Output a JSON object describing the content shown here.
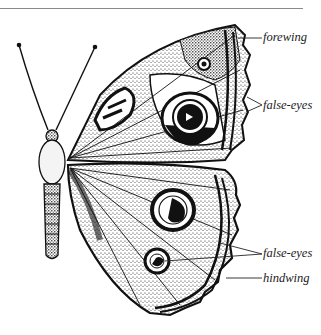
{
  "figure": {
    "labels": [
      {
        "id": "forewing",
        "text": "forewing"
      },
      {
        "id": "false-eyes-upper",
        "text": "false-eyes"
      },
      {
        "id": "false-eyes-lower",
        "text": "false-eyes"
      },
      {
        "id": "hindwing",
        "text": "hindwing"
      }
    ]
  },
  "colors": {
    "ink": "#111111",
    "paper": "#ffffff",
    "stipple": "#9a9a9a",
    "rule": "#8a8a8a"
  }
}
